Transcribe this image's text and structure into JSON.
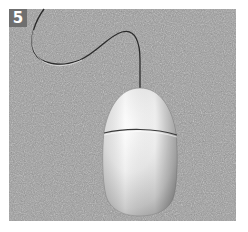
{
  "figure": {
    "step_number": "5",
    "icons": {
      "mouse": "mouse-icon",
      "cable": "mouse-cable-icon"
    },
    "colors": {
      "background": "#ffffff",
      "pad": "#9a9a9a",
      "badge": "#6f6f6f",
      "badge_text": "#ffffff",
      "mouse_body": "#e6e6e6",
      "cable": "#2a2a2a"
    }
  }
}
